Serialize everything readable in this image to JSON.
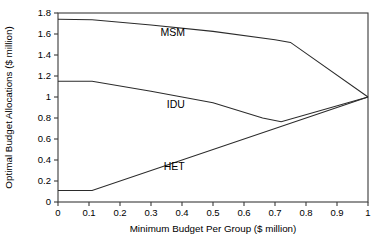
{
  "chart_data": {
    "type": "line",
    "title": "",
    "xlabel": "Minimum Budget Per Group ($ million)",
    "ylabel": "Optimal Budget Allocations ($ million)",
    "xlim": [
      0,
      1
    ],
    "ylim": [
      0,
      1.8
    ],
    "grid": false,
    "legend_position": "inline-annotations",
    "xticks": [
      0,
      0.1,
      0.2,
      0.3,
      0.4,
      0.5,
      0.6,
      0.7,
      0.8,
      0.9,
      1
    ],
    "xtick_labels": [
      "0",
      "0.1",
      "0.2",
      "0.3",
      "0.4",
      "0.5",
      "0.6",
      "0.7",
      "0.8",
      "0.9",
      "1"
    ],
    "yticks": [
      0,
      0.2,
      0.4,
      0.6,
      0.8,
      1,
      1.2,
      1.4,
      1.6,
      1.8
    ],
    "ytick_labels": [
      "0",
      "0.2",
      "0.4",
      "0.6",
      "0.8",
      "1",
      "1.2",
      "1.4",
      "1.6",
      "1.8"
    ],
    "series": [
      {
        "name": "MSM",
        "label_x": 0.37,
        "label_y": 1.585,
        "points": [
          [
            0.0,
            1.74
          ],
          [
            0.11,
            1.735
          ],
          [
            0.3,
            1.685
          ],
          [
            0.5,
            1.625
          ],
          [
            0.7,
            1.545
          ],
          [
            0.75,
            1.52
          ],
          [
            1.0,
            1.0
          ]
        ]
      },
      {
        "name": "IDU",
        "label_x": 0.38,
        "label_y": 0.9,
        "points": [
          [
            0.0,
            1.15
          ],
          [
            0.11,
            1.15
          ],
          [
            0.3,
            1.055
          ],
          [
            0.5,
            0.945
          ],
          [
            0.66,
            0.8
          ],
          [
            0.72,
            0.765
          ],
          [
            1.0,
            1.0
          ]
        ]
      },
      {
        "name": "HET",
        "label_x": 0.375,
        "label_y": 0.305,
        "points": [
          [
            0.0,
            0.11
          ],
          [
            0.11,
            0.11
          ],
          [
            1.0,
            1.0
          ]
        ]
      }
    ]
  }
}
